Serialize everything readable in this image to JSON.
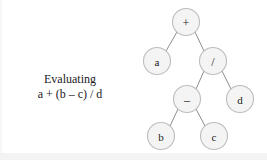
{
  "figure": {
    "background_color": "#ffffff"
  },
  "caption": {
    "line1": "Evaluating",
    "line2": "a + (b – c) / d"
  },
  "tree": {
    "node_diameter": 27,
    "node_fill": "#f4f4f4",
    "node_stroke": "#bdbdbd",
    "edge_stroke": "#8d8d8d",
    "label_color": "#1c1c1a",
    "nodes": [
      {
        "id": "root",
        "label": "+",
        "kind": "operator",
        "cx": 186,
        "cy": 22
      },
      {
        "id": "a",
        "label": "a",
        "kind": "operand",
        "cx": 157,
        "cy": 61
      },
      {
        "id": "divide",
        "label": "/",
        "kind": "operator",
        "cx": 213,
        "cy": 61
      },
      {
        "id": "minus",
        "label": "–",
        "kind": "operator",
        "cx": 187,
        "cy": 99
      },
      {
        "id": "d",
        "label": "d",
        "kind": "operand",
        "cx": 240,
        "cy": 99
      },
      {
        "id": "b",
        "label": "b",
        "kind": "operand",
        "cx": 161,
        "cy": 136
      },
      {
        "id": "c",
        "label": "c",
        "kind": "operand",
        "cx": 214,
        "cy": 136
      }
    ],
    "edges": [
      {
        "from": "root",
        "to": "a",
        "x1": 177,
        "y1": 32,
        "x2": 166,
        "y2": 51
      },
      {
        "from": "root",
        "to": "divide",
        "x1": 195,
        "y1": 32,
        "x2": 204,
        "y2": 51
      },
      {
        "from": "divide",
        "to": "minus",
        "x1": 204,
        "y1": 71,
        "x2": 196,
        "y2": 89
      },
      {
        "from": "divide",
        "to": "d",
        "x1": 222,
        "y1": 71,
        "x2": 231,
        "y2": 89
      },
      {
        "from": "minus",
        "to": "b",
        "x1": 178,
        "y1": 109,
        "x2": 170,
        "y2": 126
      },
      {
        "from": "minus",
        "to": "c",
        "x1": 196,
        "y1": 109,
        "x2": 205,
        "y2": 126
      }
    ]
  }
}
